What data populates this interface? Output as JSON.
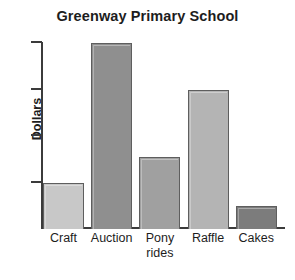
{
  "chart_data": {
    "type": "bar",
    "title": "Greenway Primary School",
    "xlabel": "",
    "ylabel": "Dollars",
    "categories": [
      "Craft",
      "Auction",
      "Pony rides",
      "Raffle",
      "Cakes"
    ],
    "category_lines": [
      [
        "Craft"
      ],
      [
        "Auction"
      ],
      [
        "Pony",
        "rides"
      ],
      [
        "Raffle"
      ],
      [
        "Cakes"
      ]
    ],
    "values": [
      1.0,
      4.0,
      1.55,
      3.0,
      0.5
    ],
    "ylim": [
      0,
      4
    ],
    "yticks": [
      1,
      2,
      3,
      4
    ],
    "ytick_labels": [
      "",
      "",
      "",
      ""
    ],
    "grid": false,
    "legend": false,
    "bar_colors": [
      "#c8c8c8",
      "#8f8f8f",
      "#a0a0a0",
      "#b4b4b4",
      "#7c7c7c"
    ],
    "bar_border_color": "#5e5e5e",
    "axis_color": "#3b3b3b",
    "background_color": "#ffffff",
    "text_color": "#1d1d1d"
  }
}
